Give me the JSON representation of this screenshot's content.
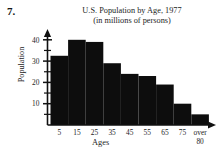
{
  "problem": {
    "number": "7."
  },
  "chart_data": {
    "type": "bar",
    "title": "U.S. Population by Age, 1977",
    "subtitle": "(in millions of persons)",
    "xlabel": "Ages",
    "ylabel": "Population",
    "categories": [
      "5",
      "15",
      "25",
      "35",
      "45",
      "55",
      "65",
      "75",
      "over 80"
    ],
    "xtick_labels": [
      "5",
      "15",
      "25",
      "35",
      "45",
      "55",
      "65",
      "75",
      "over"
    ],
    "xtick_label_second_line": "80",
    "values": [
      32.5,
      40,
      39,
      29,
      24,
      23,
      19,
      10,
      5
    ],
    "ytick_labels": [
      "10",
      "20",
      "30",
      "40"
    ],
    "ytick_values": [
      10,
      20,
      30,
      40
    ],
    "yminor_values": [
      5,
      15,
      25,
      35
    ],
    "ylim": [
      0,
      45
    ],
    "grid": false,
    "legend": "none",
    "bar_color": "#0d0d0d"
  }
}
